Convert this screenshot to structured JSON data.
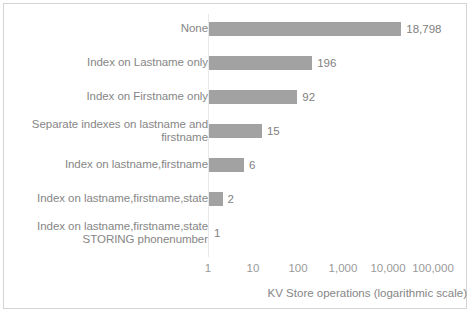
{
  "chart_data": {
    "type": "bar",
    "orientation": "horizontal",
    "title": "",
    "xlabel": "KV Store operations (logarithmic scale)",
    "ylabel": "Indexing",
    "xscale": "log",
    "xlim": [
      1,
      100000
    ],
    "xticks": [
      1,
      10,
      100,
      1000,
      10000,
      100000
    ],
    "xtick_labels": [
      "1",
      "10",
      "100",
      "1,000",
      "10,000",
      "100,000"
    ],
    "grid": false,
    "legend": false,
    "bar_color": "#a2a2a2",
    "text_color": "#868686",
    "categories": [
      "None",
      "Index on Lastname only",
      "Index on Firstname only",
      "Separate indexes on lastname and firstname",
      "Index on lastname,firstname",
      "Index on lastname,firstname,state",
      "Index on lastname,firstname,state STORING phonenumber"
    ],
    "values": [
      18798,
      196,
      92,
      15,
      6,
      2,
      1
    ],
    "value_labels": [
      "18,798",
      "196",
      "92",
      "15",
      "6",
      "2",
      "1"
    ]
  },
  "axis": {
    "y_title": "Indexing",
    "x_title": "KV Store operations (logarithmic scale)"
  },
  "categories_display": [
    {
      "lines": [
        "None"
      ]
    },
    {
      "lines": [
        "Index on Lastname only"
      ]
    },
    {
      "lines": [
        "Index on Firstname only"
      ]
    },
    {
      "lines": [
        "Separate indexes on lastname and",
        "firstname"
      ]
    },
    {
      "lines": [
        "Index on lastname,firstname"
      ]
    },
    {
      "lines": [
        "Index on lastname,firstname,state"
      ]
    },
    {
      "lines": [
        "Index on lastname,firstname,state",
        "STORING phonenumber"
      ]
    }
  ]
}
